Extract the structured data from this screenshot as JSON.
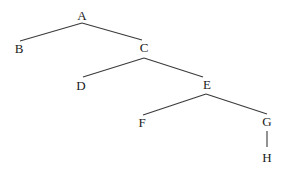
{
  "diagram": {
    "type": "tree",
    "root": "A",
    "nodes": [
      {
        "id": "A",
        "label": "A",
        "x": 82,
        "y": 20
      },
      {
        "id": "B",
        "label": "B",
        "x": 19,
        "y": 53
      },
      {
        "id": "C",
        "label": "C",
        "x": 144,
        "y": 52
      },
      {
        "id": "D",
        "label": "D",
        "x": 81,
        "y": 90
      },
      {
        "id": "E",
        "label": "E",
        "x": 207,
        "y": 89
      },
      {
        "id": "F",
        "label": "F",
        "x": 142,
        "y": 127
      },
      {
        "id": "G",
        "label": "G",
        "x": 267,
        "y": 126
      },
      {
        "id": "H",
        "label": "H",
        "x": 267,
        "y": 162
      }
    ],
    "edges": [
      {
        "from": "A",
        "to": "B",
        "x1": 82,
        "y1": 23,
        "x2": 20,
        "y2": 41
      },
      {
        "from": "A",
        "to": "C",
        "x1": 82,
        "y1": 23,
        "x2": 142,
        "y2": 40
      },
      {
        "from": "C",
        "to": "D",
        "x1": 144,
        "y1": 58,
        "x2": 83,
        "y2": 77
      },
      {
        "from": "C",
        "to": "E",
        "x1": 144,
        "y1": 58,
        "x2": 203,
        "y2": 77
      },
      {
        "from": "E",
        "to": "F",
        "x1": 206,
        "y1": 94,
        "x2": 143,
        "y2": 115
      },
      {
        "from": "E",
        "to": "G",
        "x1": 206,
        "y1": 94,
        "x2": 267,
        "y2": 114
      },
      {
        "from": "G",
        "to": "H",
        "x1": 267,
        "y1": 131,
        "x2": 267,
        "y2": 147
      }
    ]
  },
  "colors": {
    "edge": "#3a3a3a",
    "label": "#1a1a1a",
    "background": "#ffffff"
  }
}
